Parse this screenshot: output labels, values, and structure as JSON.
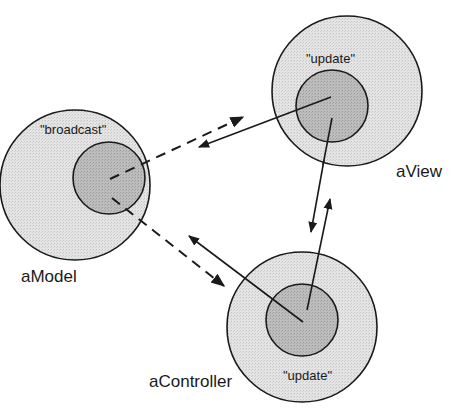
{
  "diagram": {
    "type": "MVC object interaction diagram",
    "colors": {
      "background": "#ffffff",
      "outer_fill": "#e2e2e2",
      "inner_fill": "#b8b8b8",
      "stroke": "#1a1a1a"
    },
    "nodes": [
      {
        "id": "model",
        "name": "aModel",
        "method": "\"broadcast\""
      },
      {
        "id": "view",
        "name": "aView",
        "method": "\"update\""
      },
      {
        "id": "controller",
        "name": "aController",
        "method": "\"update\""
      }
    ],
    "edges": [
      {
        "from": "model",
        "to": "view",
        "style": "dashed",
        "label": ""
      },
      {
        "from": "view",
        "to": "model",
        "style": "solid",
        "label": ""
      },
      {
        "from": "model",
        "to": "controller",
        "style": "dashed",
        "label": ""
      },
      {
        "from": "controller",
        "to": "model",
        "style": "solid",
        "label": ""
      },
      {
        "from": "view",
        "to": "controller",
        "style": "solid",
        "label": ""
      },
      {
        "from": "controller",
        "to": "view",
        "style": "solid",
        "label": ""
      }
    ]
  }
}
